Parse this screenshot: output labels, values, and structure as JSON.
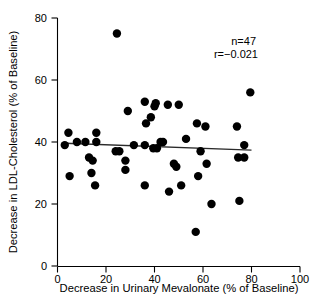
{
  "chart_data": {
    "type": "scatter",
    "title": "",
    "xlabel": "Decrease in Urinary Mevalonate (% of Baseline)",
    "ylabel": "Decrease in LDL-Cholesterol (% of Baseline)",
    "xlim": [
      0,
      100
    ],
    "ylim": [
      0,
      80
    ],
    "xticks": [
      0,
      20,
      40,
      60,
      80,
      100
    ],
    "yticks": [
      0,
      20,
      40,
      60,
      80
    ],
    "xtick_labels": [
      "0",
      "20",
      "40",
      "60",
      "80",
      "100"
    ],
    "ytick_labels": [
      "0",
      "20",
      "40",
      "60",
      "80"
    ],
    "grid": false,
    "legend": "none",
    "annotations": [
      {
        "name": "sample-size",
        "text": "n=47"
      },
      {
        "name": "correlation",
        "text": "r=−0.021"
      }
    ],
    "n": 47,
    "r": -0.021,
    "marker": {
      "shape": "circle",
      "color": "#000000",
      "size": 4.6
    },
    "points": [
      {
        "x": 3,
        "y": 39
      },
      {
        "x": 4.5,
        "y": 43
      },
      {
        "x": 5,
        "y": 29
      },
      {
        "x": 8,
        "y": 40
      },
      {
        "x": 11.5,
        "y": 40
      },
      {
        "x": 13,
        "y": 35
      },
      {
        "x": 14.5,
        "y": 34
      },
      {
        "x": 14,
        "y": 30
      },
      {
        "x": 15.5,
        "y": 26
      },
      {
        "x": 16,
        "y": 43
      },
      {
        "x": 16,
        "y": 40
      },
      {
        "x": 24.5,
        "y": 75
      },
      {
        "x": 24,
        "y": 37
      },
      {
        "x": 25.5,
        "y": 37
      },
      {
        "x": 28,
        "y": 34
      },
      {
        "x": 28,
        "y": 31
      },
      {
        "x": 29,
        "y": 50
      },
      {
        "x": 31.5,
        "y": 39
      },
      {
        "x": 36,
        "y": 53
      },
      {
        "x": 36.5,
        "y": 46
      },
      {
        "x": 36,
        "y": 39
      },
      {
        "x": 36,
        "y": 26
      },
      {
        "x": 38.5,
        "y": 48
      },
      {
        "x": 40,
        "y": 51.5
      },
      {
        "x": 40.5,
        "y": 52.5
      },
      {
        "x": 39.5,
        "y": 38
      },
      {
        "x": 41,
        "y": 38
      },
      {
        "x": 42.5,
        "y": 40
      },
      {
        "x": 43.5,
        "y": 40
      },
      {
        "x": 45.5,
        "y": 52
      },
      {
        "x": 46,
        "y": 24
      },
      {
        "x": 48,
        "y": 33
      },
      {
        "x": 49,
        "y": 32
      },
      {
        "x": 50,
        "y": 52
      },
      {
        "x": 51,
        "y": 26
      },
      {
        "x": 53,
        "y": 41
      },
      {
        "x": 57,
        "y": 11
      },
      {
        "x": 57.5,
        "y": 46
      },
      {
        "x": 58,
        "y": 29
      },
      {
        "x": 59,
        "y": 37
      },
      {
        "x": 61,
        "y": 45
      },
      {
        "x": 61.5,
        "y": 33
      },
      {
        "x": 63.5,
        "y": 20
      },
      {
        "x": 74,
        "y": 45
      },
      {
        "x": 75,
        "y": 21
      },
      {
        "x": 74.5,
        "y": 35
      },
      {
        "x": 77,
        "y": 35
      },
      {
        "x": 77,
        "y": 39
      },
      {
        "x": 79.5,
        "y": 56
      }
    ],
    "fit_line": {
      "name": "regression-line",
      "x_start": 3,
      "y_start": 39.6,
      "x_end": 80,
      "y_end": 37.4,
      "color": "#2a2a2a"
    }
  }
}
